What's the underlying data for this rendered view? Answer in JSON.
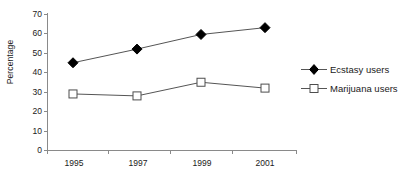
{
  "chart_data": {
    "type": "line",
    "title": "",
    "xlabel": "",
    "ylabel": "Percentage",
    "categories": [
      "1995",
      "1997",
      "1999",
      "2001"
    ],
    "ylim": [
      0,
      70
    ],
    "yticks": [
      0,
      10,
      20,
      30,
      40,
      50,
      60,
      70
    ],
    "ytick_labels": [
      "0",
      "10",
      "20",
      "30",
      "40",
      "50",
      "60",
      "70"
    ],
    "grid": false,
    "legend_position": "right",
    "series": [
      {
        "name": "Ecstasy users",
        "marker": "filled-diamond",
        "color": "#000000",
        "values": [
          45,
          52,
          59.5,
          63
        ]
      },
      {
        "name": "Marijuana users",
        "marker": "open-square",
        "color": "#000000",
        "values": [
          29,
          28,
          35,
          32
        ]
      }
    ]
  },
  "axes": {
    "y_title": "Percentage",
    "y_tick_labels": [
      "70",
      "60",
      "50",
      "40",
      "30",
      "20",
      "10",
      "0"
    ],
    "x_tick_labels": [
      "1995",
      "1997",
      "1999",
      "2001"
    ]
  },
  "legend": {
    "items": [
      {
        "label": "Ecstasy users",
        "marker": "filled-diamond"
      },
      {
        "label": "Marijuana users",
        "marker": "open-square"
      }
    ]
  },
  "colors": {
    "axis": "#8a8a8a",
    "line": "#555555",
    "marker_fill": "#000000",
    "marker_open_fill": "#ffffff",
    "text": "#1a1a1a"
  }
}
